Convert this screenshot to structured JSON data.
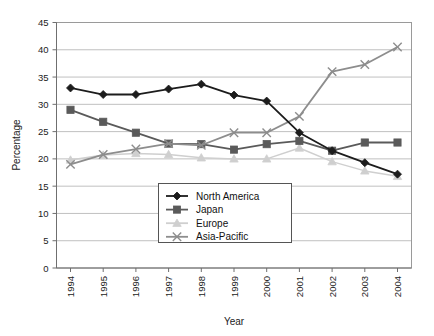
{
  "chart_data": {
    "type": "line",
    "title": "",
    "xlabel": "Year",
    "ylabel": "Percentage",
    "categories": [
      "1994",
      "1995",
      "1996",
      "1997",
      "1998",
      "1999",
      "2000",
      "2001",
      "2002",
      "2003",
      "2004"
    ],
    "x": [
      1994,
      1995,
      1996,
      1997,
      1998,
      1999,
      2000,
      2001,
      2002,
      2003,
      2004
    ],
    "ylim": [
      0,
      45
    ],
    "xlim": [
      1994,
      2004
    ],
    "yticks": [
      0,
      5,
      10,
      15,
      20,
      25,
      30,
      35,
      40,
      45
    ],
    "ytick_labels": [
      "0",
      "5",
      "10",
      "15",
      "20",
      "25",
      "30",
      "35",
      "40",
      "45"
    ],
    "grid": true,
    "grid_axis": "y",
    "legend_position": "center",
    "series": [
      {
        "name": "North America",
        "marker": "diamond",
        "color": "#1c1c1c",
        "values": [
          33.0,
          31.8,
          31.8,
          32.8,
          33.7,
          31.7,
          30.6,
          24.8,
          21.5,
          19.3,
          17.2
        ]
      },
      {
        "name": "Japan",
        "marker": "square",
        "color": "#5a5a5a",
        "values": [
          29.0,
          26.8,
          24.8,
          22.8,
          22.7,
          21.7,
          22.7,
          23.3,
          21.5,
          23.0,
          23.0
        ]
      },
      {
        "name": "Europe",
        "marker": "triangle",
        "color": "#cfcfcf",
        "values": [
          19.8,
          20.7,
          21.0,
          20.8,
          20.2,
          20.0,
          20.0,
          22.0,
          19.5,
          17.8,
          16.8
        ]
      },
      {
        "name": "Asia-Pacific",
        "marker": "cross",
        "color": "#8d8d8d",
        "values": [
          19.0,
          20.8,
          21.8,
          22.8,
          22.5,
          24.8,
          24.8,
          27.8,
          36.0,
          37.3,
          40.5
        ]
      }
    ]
  },
  "axes": {
    "y_title": "Percentage",
    "x_title": "Year"
  },
  "legend": {
    "items": [
      {
        "label": "North America"
      },
      {
        "label": "Japan"
      },
      {
        "label": "Europe"
      },
      {
        "label": "Asia-Pacific"
      }
    ]
  }
}
